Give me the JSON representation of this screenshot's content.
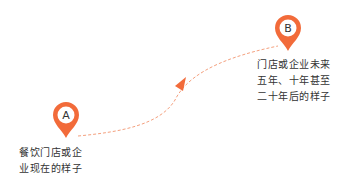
{
  "colors": {
    "accent": "#f26b3a",
    "path": "#f4a07e",
    "text": "#333333"
  },
  "points": [
    {
      "id": "A",
      "letter": "A",
      "line1": "餐饮门店或企",
      "line2": "业现在的样子"
    },
    {
      "id": "B",
      "letter": "B",
      "line1": "门店或企业未来",
      "line2": "五年、十年甚至",
      "line3": "二十年后的样子"
    }
  ]
}
